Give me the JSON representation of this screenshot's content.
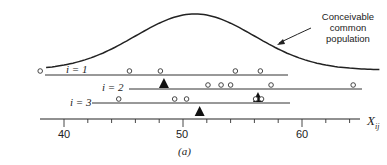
{
  "figure": {
    "caption": "(a)",
    "annotation": [
      "Conceivable",
      "common",
      "population"
    ],
    "axis": {
      "title_main": "X",
      "title_sub": "ij",
      "tick_labels": [
        "40",
        "50",
        "60"
      ]
    },
    "rows": [
      {
        "label": "i = 1"
      },
      {
        "label": "i = 2"
      },
      {
        "label": "i = 3"
      }
    ]
  },
  "chart_data": {
    "type": "scatter",
    "title": "",
    "xlabel": "X_ij",
    "ylabel": "",
    "caption": "(a)",
    "xlim": [
      37,
      65
    ],
    "x_ticks_major": [
      40,
      50,
      60
    ],
    "x_ticks_minor_step": 2,
    "grid": false,
    "legend": null,
    "annotations": [
      {
        "text": "Conceivable common population",
        "points_to": "normal density curve over all groups"
      }
    ],
    "curve": {
      "name": "Conceivable common population",
      "shape": "normal density",
      "approx_mean": 51,
      "approx_sd": 5
    },
    "series": [
      {
        "name": "i = 1",
        "observations": [
          38.0,
          45.5,
          48.1,
          54.4,
          56.5
        ],
        "group_mean": 48.4
      },
      {
        "name": "i = 2",
        "observations": [
          52.1,
          53.2,
          54.0,
          57.4,
          64.3
        ],
        "group_mean": 56.3
      },
      {
        "name": "i = 3",
        "observations": [
          44.6,
          49.3,
          50.3,
          56.1,
          56.6
        ],
        "group_mean": 51.4
      }
    ],
    "marker_legend": {
      "circle": "individual observation",
      "filled_triangle": "group sample mean"
    }
  }
}
